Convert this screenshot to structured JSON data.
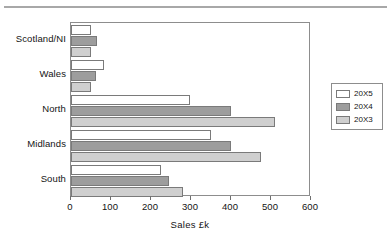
{
  "chart_data": {
    "type": "bar",
    "orientation": "horizontal",
    "title": "",
    "xlabel": "Sales  £k",
    "ylabel": "",
    "categories": [
      "South",
      "Midlands",
      "North",
      "Wales",
      "Scotland/NI"
    ],
    "series": [
      {
        "name": "20X5",
        "color": "#ffffff",
        "values": [
          225,
          350,
          298,
          82,
          50
        ]
      },
      {
        "name": "20X4",
        "color": "#9d9d9d",
        "values": [
          245,
          400,
          400,
          62,
          65
        ]
      },
      {
        "name": "20X3",
        "color": "#cfcfcf",
        "values": [
          280,
          475,
          510,
          50,
          50
        ]
      }
    ],
    "xlim": [
      0,
      600
    ],
    "xticks": [
      0,
      100,
      200,
      300,
      400,
      500,
      600
    ],
    "xtick_labels": [
      "0",
      "100",
      "200",
      "300",
      "400",
      "500",
      "600"
    ],
    "grid": false,
    "legend_position": "right-outside",
    "legend_entries": [
      "20X5",
      "20X4",
      "20X3"
    ]
  },
  "axis": {
    "x_title": "Sales  £k"
  },
  "legend": {
    "items": [
      {
        "label": "20X5"
      },
      {
        "label": "20X4"
      },
      {
        "label": "20X3"
      }
    ]
  },
  "categories": {
    "scotland_ni": "Scotland/NI",
    "wales": "Wales",
    "north": "North",
    "midlands": "Midlands",
    "south": "South"
  },
  "ticks": {
    "t0": "0",
    "t100": "100",
    "t200": "200",
    "t300": "300",
    "t400": "400",
    "t500": "500",
    "t600": "600"
  }
}
